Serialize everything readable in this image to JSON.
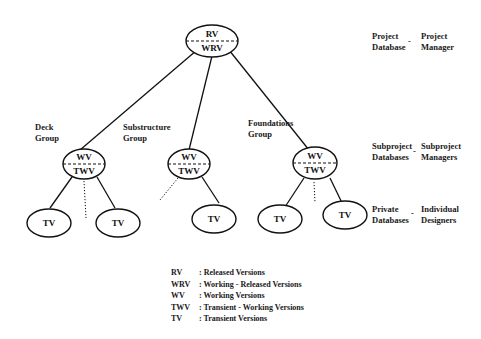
{
  "root": {
    "top": "RV",
    "bottom": "WRV"
  },
  "groups": [
    {
      "name": "Deck Group",
      "label_line1": "Deck",
      "label_line2": "Group",
      "top": "WV",
      "bottom": "TWV"
    },
    {
      "name": "Substructure Group",
      "label_line1": "Substructure",
      "label_line2": "Group",
      "top": "WV",
      "bottom": "TWV"
    },
    {
      "name": "Foundations Group",
      "label_line1": "Foundations",
      "label_line2": "Group",
      "top": "WV",
      "bottom": "TWV"
    }
  ],
  "leaves": [
    "TV",
    "TV",
    "TV",
    "TV",
    "TV"
  ],
  "levels": [
    {
      "db_line1": "Project",
      "db_line2": "Database",
      "sep": "-",
      "role_line1": "Project",
      "role_line2": "Manager"
    },
    {
      "db_line1": "Subproject",
      "db_line2": "Databases",
      "sep": "-",
      "role_line1": "Subproject",
      "role_line2": "Managers"
    },
    {
      "db_line1": "Private",
      "db_line2": "Databases",
      "sep": "-",
      "role_line1": "Individual",
      "role_line2": "Designers"
    }
  ],
  "legend": [
    {
      "abbr": "RV",
      "desc": ": Released Versions"
    },
    {
      "abbr": "WRV",
      "desc": ": Working - Released Versions"
    },
    {
      "abbr": "WV",
      "desc": ": Working Versions"
    },
    {
      "abbr": "TWV",
      "desc": ": Transient - Working Versions"
    },
    {
      "abbr": "TV",
      "desc": ": Transient Versions"
    }
  ]
}
